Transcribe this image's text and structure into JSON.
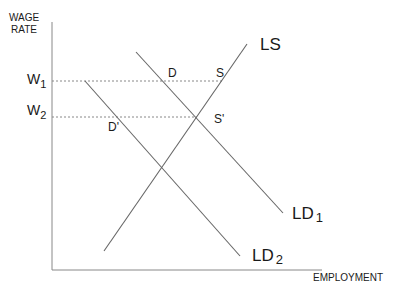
{
  "diagram": {
    "y_axis_label_line1": "WAGE",
    "y_axis_label_line2": "RATE",
    "x_axis_label": "EMPLOYMENT",
    "w1": {
      "letter": "W",
      "sub": "1"
    },
    "w2": {
      "letter": "W",
      "sub": "2"
    },
    "ls_label": "LS",
    "ld1": {
      "letter": "LD",
      "sub": "1"
    },
    "ld2": {
      "letter": "LD",
      "sub": "2"
    },
    "point_d": "D",
    "point_s": "S",
    "point_s_prime": "S'",
    "point_d_prime": "D'",
    "colors": {
      "line": "#666666",
      "axis": "#777777",
      "text": "#1a1a1a"
    }
  }
}
